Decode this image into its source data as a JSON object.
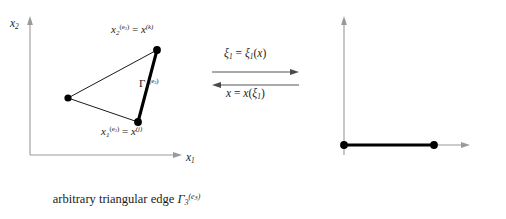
{
  "figure": {
    "left_panel": {
      "axis_x": "x",
      "axis_x_sub": "1",
      "axis_y": "x",
      "axis_y_sub": "2",
      "vertex_top_label": {
        "symbol": "x",
        "sub": "2",
        "sup": "(e",
        "sup_sub": "3",
        "sup_close": ")",
        "equals": "=",
        "rhs_symbol": "x",
        "rhs_sup": "(k)",
        "full_text": "x2(e3) = x(k)"
      },
      "vertex_bottom_label": {
        "symbol": "x",
        "sub": "1",
        "sup": "(e",
        "sup_sub": "3",
        "sup_close": ")",
        "equals": "=",
        "rhs_symbol": "x",
        "rhs_sup": "(j)",
        "full_text": "x1(e3) = x(j)"
      },
      "edge_label": {
        "symbol": "Γ",
        "sub": "3",
        "sup": "(e",
        "sup_sub": "3",
        "sup_close": ")",
        "full_text": "Γ3(e3)"
      },
      "caption_prefix": "arbitrary triangular edge",
      "caption_symbol": "Γ",
      "caption_sub": "3",
      "caption_sup": "(e",
      "caption_sup_sub": "3",
      "caption_sup_close": ")"
    },
    "mapping": {
      "forward": {
        "lhs": "ξ",
        "lhs_sub": "1",
        "equals": "=",
        "rhs": "ξ",
        "rhs_sub": "1",
        "rhs_arg_open": "(",
        "rhs_arg": "x",
        "rhs_arg_close": ")",
        "full_text": "ξ1 = ξ1(x)",
        "direction": "right"
      },
      "inverse": {
        "lhs": "x",
        "equals": "=",
        "rhs": "x",
        "rhs_arg_open": "(",
        "rhs_arg": "ξ",
        "rhs_arg_sub": "1",
        "rhs_arg_close": ")",
        "full_text": "x = x(ξ1)",
        "direction": "left"
      }
    },
    "right_panel": {
      "axis_x": "ξ",
      "axis_x_sub": "1",
      "axis_y": "ξ",
      "axis_y_sub": "2",
      "tick_start": "0",
      "tick_end": "1",
      "node_start_label": {
        "symbol": "α",
        "equals": "=",
        "value": "1",
        "full_text": "α = 1"
      },
      "node_end_label": {
        "symbol": "α",
        "equals": "=",
        "value": "2",
        "full_text": "α = 2"
      },
      "caption": "unit interval [0, 1]"
    },
    "colors": {
      "axis": "#9a9a9a",
      "thin_edge": "#1a1a1a",
      "thick_edge": "#000000",
      "node": "#000000",
      "text": "#1a1a1a",
      "background": "#ffffff"
    },
    "geometry": {
      "triangle_vertex_left": [
        68,
        98
      ],
      "triangle_vertex_top": [
        157,
        50
      ],
      "triangle_vertex_bottom": [
        138,
        122
      ],
      "highlighted_edge": "top-to-bottom",
      "interval_start": [
        344,
        145
      ],
      "interval_end": [
        434,
        145
      ]
    }
  }
}
